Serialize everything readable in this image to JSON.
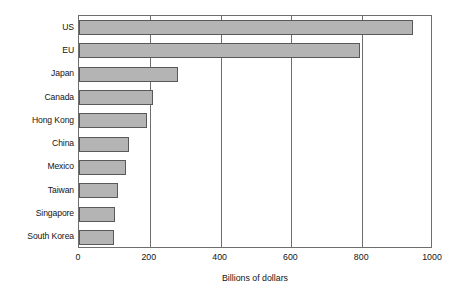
{
  "chart_data": {
    "type": "bar",
    "orientation": "horizontal",
    "title": "",
    "xlabel": "Billions of dollars",
    "ylabel": "",
    "categories": [
      "US",
      "EU",
      "Japan",
      "Canada",
      "Hong Kong",
      "China",
      "Mexico",
      "Taiwan",
      "Singapore",
      "South Korea"
    ],
    "values": [
      943,
      795,
      280,
      208,
      192,
      142,
      133,
      110,
      102,
      99
    ],
    "xlim": [
      0,
      1000
    ],
    "xticks": [
      0,
      200,
      400,
      600,
      800,
      1000
    ],
    "xtick_labels": [
      "0",
      "200",
      "400",
      "600",
      "800",
      "1000"
    ],
    "grid": "vertical",
    "legend": null,
    "series": [
      {
        "name": "",
        "values": [
          943,
          795,
          280,
          208,
          192,
          142,
          133,
          110,
          102,
          99
        ]
      }
    ],
    "colors": {
      "bar_fill": "#b4b4b4",
      "bar_border": "#595959",
      "axis": "#6e6e6e",
      "text": "#141414",
      "background": "#ffffff"
    }
  }
}
